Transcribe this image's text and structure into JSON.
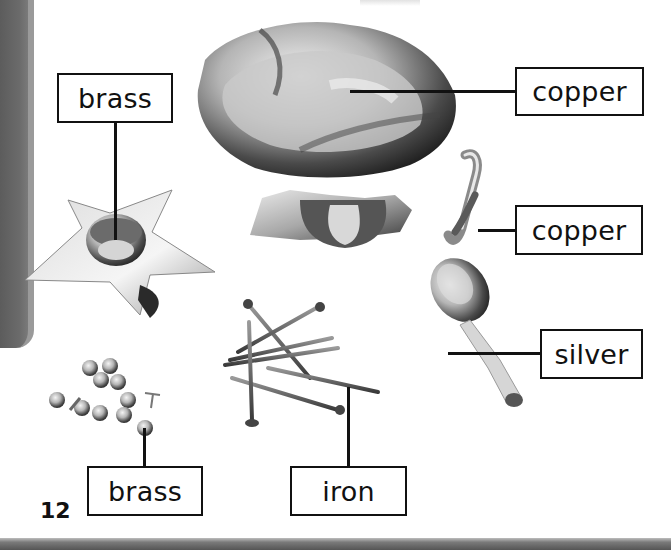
{
  "page": {
    "number": "12",
    "accent_gray": "#666666"
  },
  "labels": [
    {
      "id": "brass-star",
      "text": "brass",
      "object": "star-shaped candle holder"
    },
    {
      "id": "copper-bowl",
      "text": "copper",
      "object": "footed bowl"
    },
    {
      "id": "copper-coil",
      "text": "copper",
      "object": "coiled bracelet"
    },
    {
      "id": "silver-spoon",
      "text": "silver",
      "object": "spoon"
    },
    {
      "id": "brass-pins",
      "text": "brass",
      "object": "drawing pins"
    },
    {
      "id": "iron-nails",
      "text": "iron",
      "object": "nails"
    }
  ]
}
